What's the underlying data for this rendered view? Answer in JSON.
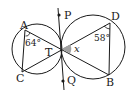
{
  "diagram": {
    "points": {
      "A": {
        "label": "A"
      },
      "C": {
        "label": "C"
      },
      "T": {
        "label": "T"
      },
      "D": {
        "label": "D"
      },
      "B": {
        "label": "B"
      },
      "P": {
        "label": "P"
      },
      "Q": {
        "label": "Q"
      }
    },
    "angles": {
      "angle_A": {
        "label": "64°",
        "value": 64
      },
      "angle_D": {
        "label": "58°",
        "value": 58
      },
      "angle_x": {
        "label": "x"
      }
    },
    "colors": {
      "stroke": "#1a1a1a",
      "angle_fill": "#a0a0a0",
      "background": "#ffffff"
    }
  }
}
